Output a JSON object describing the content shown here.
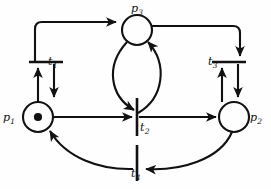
{
  "figure": {
    "name": "petri-net-diagram",
    "type": "petri-net",
    "background_color": "#fefefe",
    "stroke_color": "#111111"
  },
  "places": [
    {
      "id": "p1",
      "label": "p",
      "subscript": "1",
      "cx": 38,
      "cy": 117,
      "r": 15,
      "tokens": 1,
      "label_position": "left"
    },
    {
      "id": "p2",
      "label": "p",
      "subscript": "2",
      "cx": 234,
      "cy": 117,
      "r": 15,
      "tokens": 0,
      "label_position": "right"
    },
    {
      "id": "p3",
      "label": "p",
      "subscript": "3",
      "cx": 137,
      "cy": 30,
      "r": 15,
      "tokens": 0,
      "label_position": "top"
    }
  ],
  "transitions": [
    {
      "id": "t1",
      "label": "t",
      "subscript": "1",
      "orientation": "horizontal",
      "cx": 46,
      "cy": 62,
      "length": 34,
      "label_position": "right"
    },
    {
      "id": "t2",
      "label": "t",
      "subscript": "2",
      "orientation": "vertical",
      "cx": 137,
      "cy": 117,
      "length": 38,
      "label_position": "right-below"
    },
    {
      "id": "t3",
      "label": "t",
      "subscript": "3",
      "orientation": "horizontal",
      "cx": 229,
      "cy": 62,
      "length": 34,
      "label_position": "left"
    },
    {
      "id": "t4",
      "label": "t",
      "subscript": "4",
      "orientation": "vertical",
      "cx": 137,
      "cy": 163,
      "length": 36,
      "label_position": "below"
    }
  ],
  "arcs": [
    {
      "id": "arc-p1-to-t1",
      "from": "p1",
      "to": "t1",
      "shape": "straight-up",
      "arrow_at": "t1"
    },
    {
      "id": "arc-t1-to-p1",
      "from": "t1",
      "to": "p1",
      "shape": "straight-down",
      "arrow_at": "p1"
    },
    {
      "id": "arc-t1-to-p3",
      "from": "t1",
      "to": "p3",
      "shape": "elbow-up-right",
      "arrow_at": "p3"
    },
    {
      "id": "arc-p3-to-t3",
      "from": "p3",
      "to": "t3",
      "shape": "elbow-right-down",
      "arrow_at": "t3"
    },
    {
      "id": "arc-p2-to-t3",
      "from": "p2",
      "to": "t3",
      "shape": "straight-up",
      "arrow_at": "t3"
    },
    {
      "id": "arc-t3-to-p2",
      "from": "t3",
      "to": "p2",
      "shape": "straight-down",
      "arrow_at": "p2"
    },
    {
      "id": "arc-p3-to-t2",
      "from": "p3",
      "to": "t2",
      "shape": "curve-left-lens",
      "arrow_at": "t2"
    },
    {
      "id": "arc-t2-to-p3",
      "from": "t2",
      "to": "p3",
      "shape": "curve-right-lens",
      "arrow_at": "p3"
    },
    {
      "id": "arc-p1-to-t2",
      "from": "p1",
      "to": "t2",
      "shape": "straight-right",
      "arrow_at": "t2"
    },
    {
      "id": "arc-t2-to-p2",
      "from": "t2",
      "to": "p2",
      "shape": "straight-right",
      "arrow_at": "p2"
    },
    {
      "id": "arc-p2-to-t4",
      "from": "p2",
      "to": "t4",
      "shape": "curve-bottom",
      "arrow_at": "t4"
    },
    {
      "id": "arc-t4-to-p1",
      "from": "t4",
      "to": "p1",
      "shape": "curve-bottom",
      "arrow_at": "p1"
    }
  ]
}
